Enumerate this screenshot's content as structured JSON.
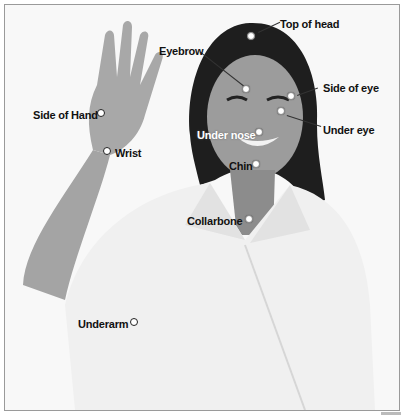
{
  "diagram": {
    "points": [
      {
        "label": "Top of head",
        "label_x": 275,
        "label_y": 13,
        "dot_x": 246,
        "dot_y": 31,
        "style": "dark"
      },
      {
        "label": "Eyebrow",
        "label_x": 154,
        "label_y": 40,
        "dot_x": 241,
        "dot_y": 84,
        "style": "dark"
      },
      {
        "label": "Side of eye",
        "label_x": 318,
        "label_y": 77,
        "dot_x": 286,
        "dot_y": 91,
        "style": "dark"
      },
      {
        "label": "Under eye",
        "label_x": 318,
        "label_y": 119,
        "dot_x": 276,
        "dot_y": 106,
        "style": "dark"
      },
      {
        "label": "Under nose",
        "label_x": 192,
        "label_y": 124,
        "dot_x": 254,
        "dot_y": 127,
        "style": "light"
      },
      {
        "label": "Chin",
        "label_x": 224,
        "label_y": 155,
        "dot_x": 251,
        "dot_y": 159,
        "style": "dark"
      },
      {
        "label": "Collarbone",
        "label_x": 186,
        "label_y": 210,
        "dot_x": 244,
        "dot_y": 214,
        "style": "dark"
      },
      {
        "label": "Side of Hand",
        "label_x": 30,
        "label_y": 104,
        "dot_x": 96,
        "dot_y": 108,
        "style": "dark"
      },
      {
        "label": "Wrist",
        "label_x": 113,
        "label_y": 142,
        "dot_x": 102,
        "dot_y": 146,
        "style": "dark"
      },
      {
        "label": "Underarm",
        "label_x": 77,
        "label_y": 313,
        "dot_x": 129,
        "dot_y": 317,
        "style": "dark"
      }
    ]
  }
}
